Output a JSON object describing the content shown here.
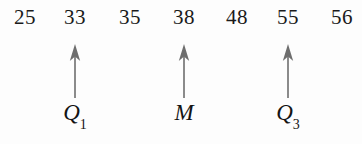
{
  "figure": {
    "background_color": "#fdfdfd",
    "value_text_color": "#1a1a1a",
    "arrow_color": "#6e6e6e",
    "label_text_color": "#141414"
  },
  "chart_data": {
    "type": "table",
    "title": "",
    "xlabel": "",
    "ylabel": "",
    "categories": [
      "25",
      "33",
      "35",
      "38",
      "48",
      "55",
      "56"
    ],
    "values": [
      25,
      33,
      35,
      38,
      48,
      55,
      56
    ],
    "annotations": [
      {
        "label": "Q1",
        "value": 33,
        "index": 1
      },
      {
        "label": "M",
        "value": 38,
        "index": 3
      },
      {
        "label": "Q3",
        "value": 55,
        "index": 5
      }
    ]
  },
  "values": [
    {
      "text": "25",
      "x": 25
    },
    {
      "text": "33",
      "x": 75
    },
    {
      "text": "35",
      "x": 130
    },
    {
      "text": "38",
      "x": 184
    },
    {
      "text": "48",
      "x": 237
    },
    {
      "text": "55",
      "x": 288
    },
    {
      "text": "56",
      "x": 342
    }
  ],
  "markers": [
    {
      "label_main": "Q",
      "label_sub": "1",
      "x": 75,
      "arrow": "up-arrow-icon"
    },
    {
      "label_main": "M",
      "label_sub": "",
      "x": 184,
      "arrow": "up-arrow-icon"
    },
    {
      "label_main": "Q",
      "label_sub": "3",
      "x": 288,
      "arrow": "up-arrow-icon"
    }
  ]
}
